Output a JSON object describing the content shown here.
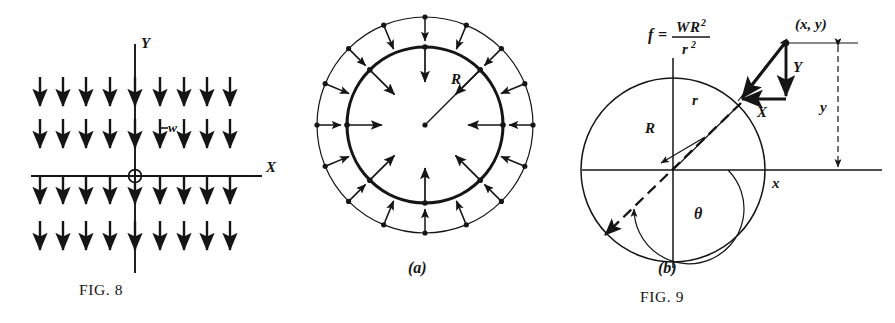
{
  "plate": {
    "name": "mechanics-figure-plate",
    "background": "#ffffff",
    "ink_color": "#151515",
    "width": 895,
    "height": 323
  },
  "figures": [
    {
      "id": "fig8",
      "caption": "FIG. 8",
      "caption_number": "8",
      "caption_prefix": "FIG.",
      "description": "uniform downward field of arrows crossing X and Y axes with origin marked",
      "axis_x_label": "X",
      "axis_y_label": "Y",
      "load_label": "w",
      "origin_marker": "circle-crossed",
      "grid": {
        "columns": 9,
        "rows": 4,
        "arrow_direction": "down"
      }
    },
    {
      "id": "fig9a",
      "caption": "(a)",
      "radius_label": "R",
      "description": "annular ring with inward arrows on inner circle and outward arrows on outer circle",
      "inner_arrow_count": 8,
      "outer_arrow_count": 16,
      "inner_arrow_direction": "inward",
      "outer_arrow_direction": "outward"
    },
    {
      "id": "fig9b",
      "caption": "(b)",
      "formula": {
        "lhs": "f",
        "equals": "=",
        "numerator_w": "W",
        "numerator_r": "R",
        "numerator_exp": "2",
        "denominator_r": "r",
        "denominator_exp": "2",
        "plain": "f = WR2/r2"
      },
      "labels": {
        "point": "(x, y)",
        "radius_R": "R",
        "radius_r": "r",
        "angle": "θ",
        "component_X": "X",
        "component_Y": "Y",
        "coord_x": "x",
        "coord_y": "y"
      }
    }
  ],
  "plate_caption": {
    "fig8": "FIG. 8",
    "fig9": "FIG. 9"
  }
}
